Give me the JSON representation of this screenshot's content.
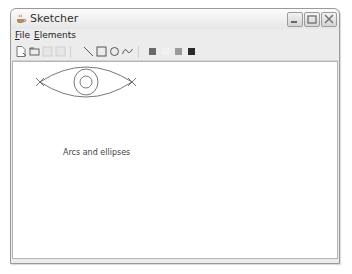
{
  "window": {
    "title": "Sketcher",
    "app_icon": "java-cup-icon",
    "controls": [
      "minimize",
      "maximize",
      "close"
    ]
  },
  "menubar": {
    "items": [
      {
        "label": "File",
        "mnemonic": "F"
      },
      {
        "label": "Elements",
        "mnemonic": "E"
      }
    ]
  },
  "toolbar": {
    "groups": [
      {
        "name": "file",
        "buttons": [
          {
            "icon": "new-document-icon",
            "enabled": true
          },
          {
            "icon": "open-folder-icon",
            "enabled": true
          },
          {
            "icon": "save-icon",
            "enabled": false
          },
          {
            "icon": "save-as-icon",
            "enabled": false
          }
        ]
      },
      {
        "name": "elements",
        "buttons": [
          {
            "icon": "line-icon",
            "enabled": true
          },
          {
            "icon": "rectangle-icon",
            "enabled": true
          },
          {
            "icon": "circle-icon",
            "enabled": true
          },
          {
            "icon": "curve-icon",
            "enabled": true
          }
        ]
      },
      {
        "name": "colors",
        "buttons": [
          {
            "icon": "color-swatch-icon",
            "color": "#6a6a6a",
            "enabled": true
          },
          {
            "icon": "color-swatch-icon",
            "color": "#f2f2f2",
            "enabled": true
          },
          {
            "icon": "color-swatch-icon",
            "color": "#9a9a9a",
            "enabled": true
          },
          {
            "icon": "color-swatch-icon",
            "color": "#2a2a2a",
            "enabled": true
          }
        ]
      }
    ]
  },
  "canvas": {
    "caption": "Arcs and ellipses",
    "drawing": "eye-shape-arcs-and-concentric-circles",
    "background": "#ffffff",
    "stroke": "#555555"
  }
}
